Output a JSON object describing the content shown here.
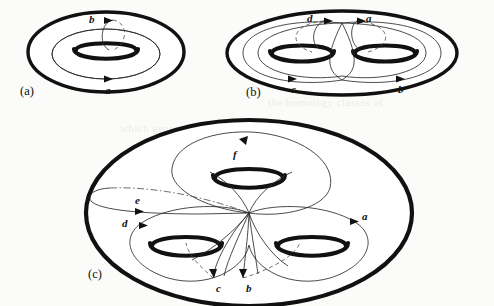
{
  "figure": {
    "background_color": "#fbfbf9",
    "ink_color": "#111111",
    "panels": [
      {
        "id": "a",
        "label": "(a)",
        "genus": 1,
        "description": "torus with generating cycles a and b",
        "cycle_labels": [
          "a",
          "b"
        ]
      },
      {
        "id": "b",
        "label": "(b)",
        "genus": 2,
        "description": "genus two surface with generating cycles a, b, c, d",
        "cycle_labels": [
          "d",
          "a",
          "c",
          "b"
        ]
      },
      {
        "id": "c",
        "label": "(c)",
        "genus": 3,
        "description": "genus three surface with generating cycles a, b, c, d, e, f",
        "cycle_labels": [
          "f",
          "e",
          "d",
          "c",
          "b",
          "a"
        ]
      }
    ],
    "panel_a": {
      "label": "(a)",
      "cycle_a": "a",
      "cycle_b": "b"
    },
    "panel_b": {
      "label": "(b)",
      "cycle_a": "a",
      "cycle_b": "b",
      "cycle_c": "c",
      "cycle_d": "d"
    },
    "panel_c": {
      "label": "(c)",
      "cycle_a": "a",
      "cycle_b": "b",
      "cycle_c": "c",
      "cycle_d": "d",
      "cycle_e": "e",
      "cycle_f": "f"
    },
    "bleed_through": [
      {
        "text": "a compact surface of genus",
        "x": 300,
        "y": 66
      },
      {
        "text": "the homology classes of",
        "x": 268,
        "y": 96
      },
      {
        "text": "which generate the first",
        "x": 120,
        "y": 122
      },
      {
        "text": "handle of the surface and",
        "x": 250,
        "y": 198
      },
      {
        "text": "intersection numbers are",
        "x": 262,
        "y": 232
      },
      {
        "text": "the canonical basis",
        "x": 286,
        "y": 262
      }
    ]
  }
}
